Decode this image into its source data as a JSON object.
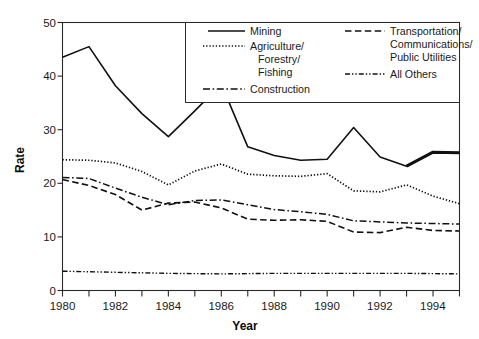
{
  "chart_data": {
    "type": "line",
    "title": "",
    "xlabel": "Year",
    "ylabel": "Rate",
    "xlim": [
      1980,
      1995
    ],
    "ylim": [
      0,
      50
    ],
    "ytick_values": [
      0,
      10,
      20,
      30,
      40,
      50
    ],
    "ytick_labels": [
      "0",
      "10",
      "20",
      "30",
      "40",
      "50"
    ],
    "xtick_values": [
      1980,
      1982,
      1984,
      1986,
      1988,
      1990,
      1992,
      1994
    ],
    "xtick_labels": [
      "1980",
      "1982",
      "1984",
      "1986",
      "1988",
      "1990",
      "1992",
      "1994"
    ],
    "xtick_minor_values": [
      1981,
      1983,
      1985,
      1987,
      1989,
      1991,
      1993,
      1995
    ],
    "grid": false,
    "legend_position": "top-right-inside",
    "x": [
      1980,
      1981,
      1982,
      1983,
      1984,
      1985,
      1986,
      1987,
      1988,
      1989,
      1990,
      1991,
      1992,
      1993,
      1994,
      1995
    ],
    "series": [
      {
        "name": "Mining",
        "style": "solid",
        "values": [
          43.5,
          45.5,
          38.2,
          33.0,
          28.7,
          33.5,
          38.5,
          26.8,
          25.2,
          24.3,
          24.5,
          30.4,
          24.9,
          23.2,
          25.8,
          25.7
        ]
      },
      {
        "name": "Agriculture/ Forestry/ Fishing",
        "style": "dotted",
        "values": [
          24.4,
          24.3,
          23.8,
          22.2,
          19.7,
          22.3,
          23.6,
          21.7,
          21.4,
          21.3,
          21.8,
          18.6,
          18.4,
          19.7,
          17.6,
          16.2
        ]
      },
      {
        "name": "Construction",
        "style": "dashdot",
        "values": [
          21.1,
          20.9,
          19.1,
          17.4,
          16.0,
          16.8,
          16.9,
          16.0,
          15.1,
          14.7,
          14.2,
          13.0,
          12.8,
          12.6,
          12.5,
          12.4
        ]
      },
      {
        "name": "Transportation/ Communications/ Public Utilities",
        "style": "dashed",
        "values": [
          20.7,
          19.6,
          17.9,
          15.0,
          16.3,
          16.5,
          15.4,
          13.3,
          13.1,
          13.2,
          12.9,
          10.9,
          10.8,
          11.8,
          11.2,
          11.1
        ]
      },
      {
        "name": "All Others",
        "style": "dashdotdot",
        "values": [
          3.6,
          3.5,
          3.4,
          3.3,
          3.2,
          3.15,
          3.1,
          3.15,
          3.2,
          3.2,
          3.2,
          3.2,
          3.2,
          3.2,
          3.15,
          3.1
        ]
      }
    ]
  },
  "legend": {
    "col1": [
      {
        "label": "Mining",
        "style": "solid"
      },
      {
        "label": "Agriculture/",
        "label2": "Forestry/",
        "label3": "Fishing",
        "style": "dotted"
      },
      {
        "label": "Construction",
        "style": "dashdot"
      }
    ],
    "col2": [
      {
        "label": "Transportation/",
        "label2": "Communications/",
        "label3": "Public Utilities",
        "style": "dashed"
      },
      {
        "label": "All Others",
        "style": "dashdotdot"
      }
    ]
  },
  "labels": {
    "y_axis_title": "Rate",
    "x_axis_title": "Year",
    "y0": "0",
    "y10": "10",
    "y20": "20",
    "y30": "30",
    "y40": "40",
    "y50": "50",
    "x1980": "1980",
    "x1982": "1982",
    "x1984": "1984",
    "x1986": "1986",
    "x1988": "1988",
    "x1990": "1990",
    "x1992": "1992",
    "x1994": "1994",
    "legend_mining": "Mining",
    "legend_agriculture_1": "Agriculture/",
    "legend_agriculture_2": "Forestry/",
    "legend_agriculture_3": "Fishing",
    "legend_construction": "Construction",
    "legend_transportation_1": "Transportation/",
    "legend_transportation_2": "Communications/",
    "legend_transportation_3": "Public Utilities",
    "legend_allothers": "All Others"
  },
  "colors": {
    "line": "#111111",
    "frame": "#2a2a2a",
    "text": "#1a1a1a",
    "background": "#ffffff"
  }
}
